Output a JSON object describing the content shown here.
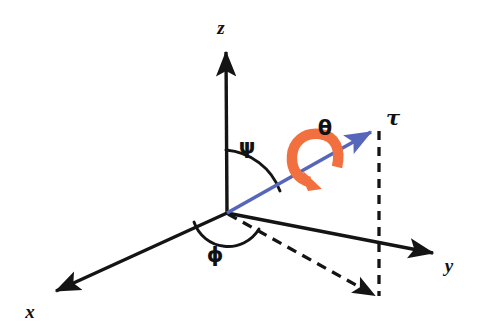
{
  "figure": {
    "name": "spherical-coordinate-torque-diagram",
    "background": "#ffffff",
    "width": 482,
    "height": 328
  },
  "colors": {
    "axis": "#141414",
    "vector": "#5566bb",
    "rotation": "#f2703f",
    "dashed": "#141414",
    "text": "#111111"
  },
  "axes": [
    {
      "id": "z",
      "label": "z",
      "from": [
        227,
        213
      ],
      "to": [
        226,
        48
      ],
      "label_pos": [
        221,
        34
      ],
      "style": "solid",
      "arrow": true
    },
    {
      "id": "x",
      "label": "x",
      "from": [
        227,
        213
      ],
      "to": [
        50,
        294
      ],
      "label_pos": [
        30,
        318
      ],
      "style": "solid",
      "arrow": true
    },
    {
      "id": "y",
      "label": "y",
      "from": [
        227,
        213
      ],
      "to": [
        440,
        254
      ],
      "label_pos": [
        449,
        272
      ],
      "style": "solid",
      "arrow": true
    }
  ],
  "vector": {
    "id": "tau",
    "label": "τ",
    "from": [
      227,
      213
    ],
    "to": [
      377,
      129
    ],
    "label_pos": [
      390,
      124
    ],
    "color": "#5566bb",
    "arrow": true
  },
  "projection_lines": [
    {
      "id": "tau-vertical-drop",
      "from": [
        379,
        129
      ],
      "to": [
        379,
        297
      ],
      "style": "dashed",
      "arrow": true
    },
    {
      "id": "tau-ground-projection",
      "from": [
        227,
        213
      ],
      "to": [
        379,
        297
      ],
      "style": "dashed",
      "arrow": false
    }
  ],
  "angles": [
    {
      "id": "psi",
      "label": "ψ",
      "label_pos": [
        246,
        153
      ],
      "description": "polar angle between z-axis and tau vector",
      "arc_from": [
        226,
        148
      ],
      "arc_to": [
        285,
        188
      ]
    },
    {
      "id": "phi",
      "label": "ϕ",
      "label_pos": [
        214,
        261
      ],
      "description": "azimuthal angle between x-axis and ground projection of tau",
      "arc_from": [
        193,
        222
      ],
      "arc_to": [
        258,
        229
      ]
    },
    {
      "id": "theta",
      "label": "θ",
      "label_pos": [
        324,
        134
      ],
      "description": "rotation angle about the tau axis",
      "color": "#f2703f"
    }
  ],
  "rotation_arrow": {
    "id": "theta-rotation-loop",
    "color": "#f2703f",
    "center": [
      317,
      156
    ],
    "description": "curved orange arrow looping around the tau vector indicating rotation theta"
  }
}
